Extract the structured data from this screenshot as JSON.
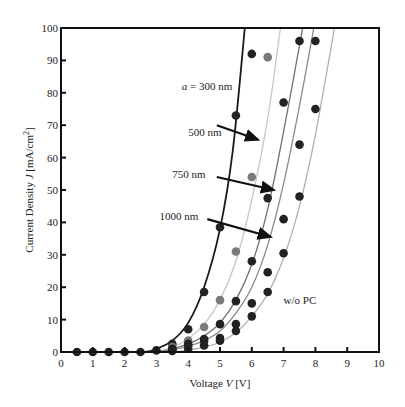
{
  "chart_data": {
    "type": "scatter",
    "title": "",
    "xlabel": "Voltage V [V]",
    "ylabel": "Current Density J [mA/cm²]",
    "xlim": [
      0,
      10
    ],
    "ylim": [
      0,
      100
    ],
    "xticks": [
      0,
      1,
      2,
      3,
      4,
      5,
      6,
      7,
      8,
      9,
      10
    ],
    "yticks": [
      0,
      10,
      20,
      30,
      40,
      50,
      60,
      70,
      80,
      90,
      100
    ],
    "grid": false,
    "annotations": [
      {
        "text": "a = 300 nm",
        "x": 3.8,
        "y": 82
      },
      {
        "text": "500 nm",
        "x": 4.0,
        "y": 68
      },
      {
        "text": "750 nm",
        "x": 3.5,
        "y": 55
      },
      {
        "text": "1000 nm",
        "x": 3.1,
        "y": 42
      },
      {
        "text": "w/o PC",
        "x": 7.0,
        "y": 16
      }
    ],
    "series": [
      {
        "name": "a = 300 nm",
        "color": "#1a1a1a",
        "curve": [
          [
            2.5,
            0
          ],
          [
            3,
            1
          ],
          [
            3.5,
            3.5
          ],
          [
            4,
            9
          ],
          [
            4.5,
            20
          ],
          [
            5,
            38
          ],
          [
            5.4,
            62
          ],
          [
            5.78,
            100
          ]
        ],
        "points": [
          [
            0.5,
            0
          ],
          [
            1,
            0
          ],
          [
            1.5,
            0
          ],
          [
            2,
            0
          ],
          [
            2.5,
            0
          ],
          [
            3,
            0.5
          ],
          [
            3.5,
            2.5
          ],
          [
            4,
            7
          ],
          [
            4.5,
            18.5
          ],
          [
            5,
            38.5
          ],
          [
            5.5,
            73
          ],
          [
            6,
            92
          ]
        ]
      },
      {
        "name": "500 nm",
        "color": "#c8c8c8",
        "curve": [
          [
            2.8,
            0
          ],
          [
            3.5,
            1.5
          ],
          [
            4,
            4
          ],
          [
            4.5,
            8.5
          ],
          [
            5,
            16
          ],
          [
            5.5,
            28
          ],
          [
            6,
            47
          ],
          [
            6.5,
            72
          ],
          [
            6.9,
            100
          ]
        ],
        "points": [
          [
            3.5,
            1.5
          ],
          [
            4,
            3.5
          ],
          [
            4.5,
            7.7
          ],
          [
            5,
            16
          ],
          [
            5.5,
            31
          ],
          [
            6,
            54
          ],
          [
            6.5,
            91
          ]
        ]
      },
      {
        "name": "750 nm",
        "color": "#707070",
        "curve": [
          [
            3,
            0
          ],
          [
            4,
            2.5
          ],
          [
            4.5,
            5
          ],
          [
            5,
            9
          ],
          [
            5.5,
            16
          ],
          [
            6,
            27
          ],
          [
            6.5,
            44
          ],
          [
            7,
            68
          ],
          [
            7.6,
            100
          ]
        ],
        "points": [
          [
            3.5,
            1
          ],
          [
            4,
            2.5
          ],
          [
            4.5,
            4
          ],
          [
            5,
            8.6
          ],
          [
            5.5,
            15.7
          ],
          [
            6,
            28
          ],
          [
            6.5,
            47.5
          ],
          [
            7,
            77
          ],
          [
            7.5,
            96
          ]
        ]
      },
      {
        "name": "1000 nm",
        "color": "#8a8a8a",
        "curve": [
          [
            3,
            0
          ],
          [
            4,
            1.8
          ],
          [
            4.5,
            3.5
          ],
          [
            5,
            6.5
          ],
          [
            5.5,
            12
          ],
          [
            6,
            20
          ],
          [
            6.5,
            33
          ],
          [
            7,
            52
          ],
          [
            7.5,
            76
          ],
          [
            7.95,
            100
          ]
        ],
        "points": [
          [
            3.5,
            0.8
          ],
          [
            4,
            2
          ],
          [
            4.5,
            3.4
          ],
          [
            5,
            4.3
          ],
          [
            5.5,
            8.6
          ],
          [
            6,
            15
          ],
          [
            6.5,
            24.6
          ],
          [
            7,
            41
          ],
          [
            7.5,
            64
          ],
          [
            8,
            96
          ]
        ]
      },
      {
        "name": "w/o PC",
        "color": "#b0b0b0",
        "curve": [
          [
            3.5,
            0
          ],
          [
            4.5,
            1.5
          ],
          [
            5,
            3
          ],
          [
            5.5,
            6
          ],
          [
            6,
            11
          ],
          [
            6.5,
            18
          ],
          [
            7,
            29
          ],
          [
            7.5,
            45
          ],
          [
            8,
            67
          ],
          [
            8.6,
            100
          ]
        ],
        "points": [
          [
            3.5,
            0.3
          ],
          [
            4,
            1
          ],
          [
            4.5,
            2
          ],
          [
            5,
            3.5
          ],
          [
            5.5,
            6.5
          ],
          [
            6,
            11
          ],
          [
            6.5,
            18.5
          ],
          [
            7,
            30.5
          ],
          [
            7.5,
            48
          ],
          [
            8,
            75
          ]
        ]
      }
    ]
  },
  "labels": {
    "xlabel_prefix": "Voltage ",
    "xlabel_var": "V",
    "xlabel_unit": " [V]",
    "ylabel_prefix": "Current Density ",
    "ylabel_var": "J",
    "ylabel_unit": " [mA/cm",
    "ylabel_sup": "2",
    "ylabel_close": "]"
  }
}
